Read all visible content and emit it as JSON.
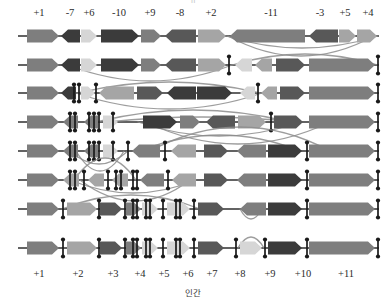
{
  "figure": {
    "caption": "인간",
    "top_cut_text": "ㅍ",
    "width": 387,
    "height": 304,
    "geometry": {
      "left_margin": 18,
      "right_margin": 375,
      "row_y": [
        36,
        65,
        93,
        122,
        151,
        180,
        209,
        248
      ],
      "baseline_color": "#2f2f2f",
      "arc_color": "#8c8c8c",
      "marker_color": "#1a1a1a"
    },
    "palette": {
      "very_dark": "#3b3b3b",
      "dark": "#585858",
      "medium": "#7e7e7e",
      "light": "#a5a5a5",
      "very_light": "#c4c4c4",
      "pale": "#d6d6d6"
    },
    "top_axis": {
      "name": "ancestral-block-labels",
      "labels": [
        {
          "text": "+1",
          "x": 39
        },
        {
          "text": "-7",
          "x": 70
        },
        {
          "text": "+6",
          "x": 89
        },
        {
          "text": "-10",
          "x": 119
        },
        {
          "text": "+9",
          "x": 150
        },
        {
          "text": "-8",
          "x": 180
        },
        {
          "text": "+2",
          "x": 211
        },
        {
          "text": "-11",
          "x": 271
        },
        {
          "text": "-3",
          "x": 320
        },
        {
          "text": "+5",
          "x": 345
        },
        {
          "text": "+4",
          "x": 368
        }
      ]
    },
    "bottom_axis": {
      "name": "human-block-labels",
      "labels": [
        {
          "text": "+1",
          "x": 39
        },
        {
          "text": "+2",
          "x": 78
        },
        {
          "text": "+3",
          "x": 113
        },
        {
          "text": "+4",
          "x": 140
        },
        {
          "text": "+5",
          "x": 164
        },
        {
          "text": "+6",
          "x": 188
        },
        {
          "text": "+7",
          "x": 212
        },
        {
          "text": "+8",
          "x": 240
        },
        {
          "text": "+9",
          "x": 270
        },
        {
          "text": "+10",
          "x": 303
        },
        {
          "text": "+11",
          "x": 346
        }
      ]
    },
    "rows": [
      {
        "name": "row-1-ancestral",
        "y": 36,
        "blocks": [
          {
            "x1": 27,
            "x2": 59,
            "dir": "right",
            "shade": "medium"
          },
          {
            "x1": 61,
            "x2": 80,
            "dir": "left",
            "shade": "very_dark"
          },
          {
            "x1": 81,
            "x2": 97,
            "dir": "right",
            "shade": "pale"
          },
          {
            "x1": 101,
            "x2": 139,
            "dir": "right",
            "shade": "very_dark"
          },
          {
            "x1": 141,
            "x2": 161,
            "dir": "right",
            "shade": "medium"
          },
          {
            "x1": 165,
            "x2": 196,
            "dir": "left",
            "shade": "dark"
          },
          {
            "x1": 198,
            "x2": 226,
            "dir": "right",
            "shade": "light"
          },
          {
            "x1": 230,
            "x2": 305,
            "dir": "left",
            "shade": "medium"
          },
          {
            "x1": 309,
            "x2": 338,
            "dir": "left",
            "shade": "dark"
          },
          {
            "x1": 339,
            "x2": 356,
            "dir": "right",
            "shade": "light"
          },
          {
            "x1": 357,
            "x2": 377,
            "dir": "right",
            "shade": "light"
          }
        ],
        "markers": [],
        "arcs": [
          {
            "x1": 226,
            "x2": 378,
            "side": "below",
            "h": 12
          },
          {
            "x1": 228,
            "x2": 374,
            "side": "below",
            "h": 20
          }
        ]
      },
      {
        "name": "row-2",
        "y": 65,
        "blocks": [
          {
            "x1": 27,
            "x2": 59,
            "dir": "right",
            "shade": "medium"
          },
          {
            "x1": 61,
            "x2": 80,
            "dir": "left",
            "shade": "very_dark"
          },
          {
            "x1": 81,
            "x2": 97,
            "dir": "right",
            "shade": "pale"
          },
          {
            "x1": 101,
            "x2": 139,
            "dir": "right",
            "shade": "very_dark"
          },
          {
            "x1": 141,
            "x2": 161,
            "dir": "right",
            "shade": "medium"
          },
          {
            "x1": 165,
            "x2": 196,
            "dir": "left",
            "shade": "dark"
          },
          {
            "x1": 198,
            "x2": 226,
            "dir": "right",
            "shade": "light"
          },
          {
            "x1": 235,
            "x2": 252,
            "dir": "left",
            "shade": "pale"
          },
          {
            "x1": 255,
            "x2": 272,
            "dir": "left",
            "shade": "light"
          },
          {
            "x1": 276,
            "x2": 305,
            "dir": "right",
            "shade": "dark"
          },
          {
            "x1": 309,
            "x2": 375,
            "dir": "right",
            "shade": "medium"
          }
        ],
        "markers": [
          229,
          378
        ],
        "arcs": [
          {
            "x1": 68,
            "x2": 232,
            "side": "below",
            "h": 16
          },
          {
            "x1": 232,
            "x2": 378,
            "side": "above",
            "h": 11
          }
        ]
      },
      {
        "name": "row-3",
        "y": 93,
        "blocks": [
          {
            "x1": 27,
            "x2": 59,
            "dir": "right",
            "shade": "medium"
          },
          {
            "x1": 61,
            "x2": 76,
            "dir": "left",
            "shade": "very_dark"
          },
          {
            "x1": 81,
            "x2": 95,
            "dir": "right",
            "shade": "pale"
          },
          {
            "x1": 99,
            "x2": 134,
            "dir": "left",
            "shade": "light"
          },
          {
            "x1": 137,
            "x2": 163,
            "dir": "right",
            "shade": "dark"
          },
          {
            "x1": 167,
            "x2": 196,
            "dir": "left",
            "shade": "very_dark"
          },
          {
            "x1": 197,
            "x2": 232,
            "dir": "right",
            "shade": "very_dark"
          },
          {
            "x1": 240,
            "x2": 255,
            "dir": "left",
            "shade": "pale"
          },
          {
            "x1": 261,
            "x2": 277,
            "dir": "left",
            "shade": "light"
          },
          {
            "x1": 280,
            "x2": 305,
            "dir": "right",
            "shade": "dark"
          },
          {
            "x1": 309,
            "x2": 375,
            "dir": "right",
            "shade": "medium"
          }
        ],
        "markers": [
          74,
          79,
          96,
          258,
          378
        ],
        "arcs": [
          {
            "x1": 76,
            "x2": 262,
            "side": "below",
            "h": 16
          },
          {
            "x1": 78,
            "x2": 260,
            "side": "above",
            "h": 11
          }
        ]
      },
      {
        "name": "row-4",
        "y": 122,
        "blocks": [
          {
            "x1": 27,
            "x2": 59,
            "dir": "right",
            "shade": "medium"
          },
          {
            "x1": 63,
            "x2": 78,
            "dir": "left",
            "shade": "medium"
          },
          {
            "x1": 84,
            "x2": 98,
            "dir": "left",
            "shade": "medium"
          },
          {
            "x1": 103,
            "x2": 118,
            "dir": "right",
            "shade": "pale"
          },
          {
            "x1": 143,
            "x2": 177,
            "dir": "right",
            "shade": "very_dark"
          },
          {
            "x1": 180,
            "x2": 200,
            "dir": "right",
            "shade": "medium"
          },
          {
            "x1": 206,
            "x2": 235,
            "dir": "left",
            "shade": "dark"
          },
          {
            "x1": 238,
            "x2": 266,
            "dir": "right",
            "shade": "light"
          },
          {
            "x1": 274,
            "x2": 303,
            "dir": "right",
            "shade": "dark"
          },
          {
            "x1": 309,
            "x2": 375,
            "dir": "right",
            "shade": "medium"
          }
        ],
        "markers": [
          70,
          75,
          89,
          94,
          99,
          113,
          271,
          378
        ],
        "arcs": [
          {
            "x1": 96,
            "x2": 290,
            "side": "above",
            "h": 12
          },
          {
            "x1": 108,
            "x2": 296,
            "side": "above",
            "h": 5
          },
          {
            "x1": 138,
            "x2": 300,
            "side": "below",
            "h": 14
          },
          {
            "x1": 146,
            "x2": 330,
            "side": "below",
            "h": 22
          }
        ]
      },
      {
        "name": "row-5",
        "y": 151,
        "blocks": [
          {
            "x1": 27,
            "x2": 59,
            "dir": "right",
            "shade": "medium"
          },
          {
            "x1": 63,
            "x2": 78,
            "dir": "left",
            "shade": "medium"
          },
          {
            "x1": 84,
            "x2": 98,
            "dir": "left",
            "shade": "medium"
          },
          {
            "x1": 103,
            "x2": 118,
            "dir": "right",
            "shade": "pale"
          },
          {
            "x1": 132,
            "x2": 160,
            "dir": "left",
            "shade": "medium"
          },
          {
            "x1": 171,
            "x2": 196,
            "dir": "left",
            "shade": "light"
          },
          {
            "x1": 204,
            "x2": 228,
            "dir": "right",
            "shade": "dark"
          },
          {
            "x1": 237,
            "x2": 266,
            "dir": "left",
            "shade": "medium"
          },
          {
            "x1": 268,
            "x2": 302,
            "dir": "right",
            "shade": "very_dark"
          },
          {
            "x1": 309,
            "x2": 375,
            "dir": "right",
            "shade": "medium"
          }
        ],
        "markers": [
          70,
          75,
          89,
          94,
          99,
          113,
          128,
          165,
          307,
          378
        ],
        "arcs": [
          {
            "x1": 140,
            "x2": 300,
            "side": "above",
            "h": 16
          },
          {
            "x1": 150,
            "x2": 330,
            "side": "above",
            "h": 24
          },
          {
            "x1": 70,
            "x2": 128,
            "side": "below",
            "h": 13
          },
          {
            "x1": 76,
            "x2": 124,
            "side": "below",
            "h": 20
          }
        ]
      },
      {
        "name": "row-6",
        "y": 180,
        "blocks": [
          {
            "x1": 27,
            "x2": 59,
            "dir": "right",
            "shade": "medium"
          },
          {
            "x1": 63,
            "x2": 79,
            "dir": "left",
            "shade": "light"
          },
          {
            "x1": 88,
            "x2": 104,
            "dir": "left",
            "shade": "light"
          },
          {
            "x1": 112,
            "x2": 128,
            "dir": "left",
            "shade": "light"
          },
          {
            "x1": 140,
            "x2": 164,
            "dir": "left",
            "shade": "medium"
          },
          {
            "x1": 172,
            "x2": 196,
            "dir": "left",
            "shade": "light"
          },
          {
            "x1": 204,
            "x2": 228,
            "dir": "right",
            "shade": "dark"
          },
          {
            "x1": 237,
            "x2": 266,
            "dir": "left",
            "shade": "medium"
          },
          {
            "x1": 268,
            "x2": 302,
            "dir": "right",
            "shade": "very_dark"
          },
          {
            "x1": 309,
            "x2": 375,
            "dir": "right",
            "shade": "medium"
          }
        ],
        "markers": [
          70,
          75,
          84,
          108,
          116,
          121,
          133,
          137,
          168,
          307,
          378
        ],
        "arcs": [
          {
            "x1": 70,
            "x2": 196,
            "side": "below",
            "h": 13
          },
          {
            "x1": 80,
            "x2": 190,
            "side": "below",
            "h": 21
          },
          {
            "x1": 74,
            "x2": 136,
            "side": "above",
            "h": 22
          }
        ]
      },
      {
        "name": "row-7",
        "y": 209,
        "blocks": [
          {
            "x1": 27,
            "x2": 59,
            "dir": "right",
            "shade": "medium"
          },
          {
            "x1": 67,
            "x2": 97,
            "dir": "right",
            "shade": "light"
          },
          {
            "x1": 100,
            "x2": 122,
            "dir": "right",
            "shade": "dark"
          },
          {
            "x1": 126,
            "x2": 141,
            "dir": "right",
            "shade": "medium"
          },
          {
            "x1": 142,
            "x2": 158,
            "dir": "right",
            "shade": "pale"
          },
          {
            "x1": 167,
            "x2": 190,
            "dir": "right",
            "shade": "pale"
          },
          {
            "x1": 198,
            "x2": 224,
            "dir": "right",
            "shade": "dark"
          },
          {
            "x1": 240,
            "x2": 266,
            "dir": "left",
            "shade": "medium"
          },
          {
            "x1": 268,
            "x2": 302,
            "dir": "right",
            "shade": "very_dark"
          },
          {
            "x1": 309,
            "x2": 375,
            "dir": "right",
            "shade": "medium"
          }
        ],
        "markers": [
          63,
          99,
          125,
          133,
          137,
          146,
          150,
          163,
          176,
          180,
          194,
          307,
          378
        ],
        "arcs": [
          {
            "x1": 62,
            "x2": 200,
            "side": "above",
            "h": 14
          },
          {
            "x1": 240,
            "x2": 262,
            "side": "below",
            "h": 10
          }
        ]
      },
      {
        "name": "row-8-human",
        "y": 248,
        "blocks": [
          {
            "x1": 27,
            "x2": 59,
            "dir": "right",
            "shade": "medium"
          },
          {
            "x1": 67,
            "x2": 97,
            "dir": "right",
            "shade": "light"
          },
          {
            "x1": 100,
            "x2": 122,
            "dir": "right",
            "shade": "dark"
          },
          {
            "x1": 126,
            "x2": 141,
            "dir": "right",
            "shade": "medium"
          },
          {
            "x1": 142,
            "x2": 158,
            "dir": "right",
            "shade": "pale"
          },
          {
            "x1": 167,
            "x2": 190,
            "dir": "right",
            "shade": "pale"
          },
          {
            "x1": 198,
            "x2": 224,
            "dir": "right",
            "shade": "dark"
          },
          {
            "x1": 240,
            "x2": 262,
            "dir": "right",
            "shade": "pale"
          },
          {
            "x1": 268,
            "x2": 302,
            "dir": "right",
            "shade": "very_dark"
          },
          {
            "x1": 309,
            "x2": 375,
            "dir": "right",
            "shade": "medium"
          }
        ],
        "markers": [
          63,
          99,
          125,
          133,
          137,
          146,
          150,
          163,
          176,
          180,
          194,
          236,
          265,
          307,
          378
        ],
        "arcs": [
          {
            "x1": 238,
            "x2": 264,
            "side": "above",
            "h": 11
          }
        ]
      }
    ]
  }
}
